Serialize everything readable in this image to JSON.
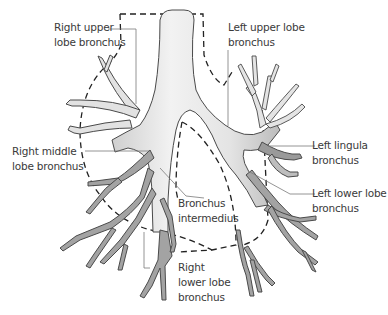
{
  "diagram": {
    "colors": {
      "upper_airway_fill": "#e6e6e6",
      "lower_airway_fill": "#9a9a9a",
      "outline": "#4a4a4a",
      "leader_line": "#7a7a7a",
      "dashed_boundary": "#222222",
      "label_text": "#3a3a3a"
    },
    "labels": {
      "right_upper_lobe": {
        "line1": "Right upper",
        "line2": "lobe bronchus"
      },
      "left_upper_lobe": {
        "line1": "Left upper lobe",
        "line2": "bronchus"
      },
      "right_middle_lobe": {
        "line1": "Right middle",
        "line2": "lobe bronchus"
      },
      "left_lingula": {
        "line1": "Left lingula",
        "line2": "bronchus"
      },
      "left_lower_lobe": {
        "line1": "Left lower lobe",
        "line2": "bronchus"
      },
      "bronchus_intermedius": {
        "line1": "Bronchus",
        "line2": "intermedius"
      },
      "right_lower_lobe": {
        "line1": "Right",
        "line2": "lower lobe",
        "line3": "bronchus"
      }
    }
  }
}
